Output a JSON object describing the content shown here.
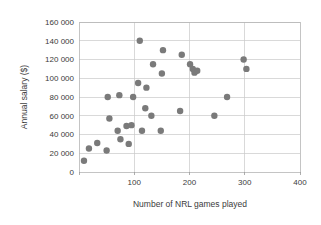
{
  "chart_data": {
    "type": "scatter",
    "title": "",
    "xlabel": "Number of NRL games played",
    "ylabel": "Annual salary ($)",
    "xlim": [
      0,
      400
    ],
    "ylim": [
      0,
      160000
    ],
    "grid": true,
    "legend": "none",
    "marker_color": "#7a7a7a",
    "xticks": [
      0,
      100,
      200,
      300,
      400
    ],
    "xtick_labels": [
      "",
      "100",
      "200",
      "300",
      "400"
    ],
    "yticks": [
      0,
      20000,
      40000,
      60000,
      80000,
      100000,
      120000,
      140000,
      160000
    ],
    "ytick_labels": [
      "0",
      "20 000",
      "40 000",
      "60 000",
      "80 000",
      "100 000",
      "120 000",
      "140 000",
      "160 000"
    ],
    "points": [
      [
        9,
        12000
      ],
      [
        18,
        25000
      ],
      [
        33,
        31000
      ],
      [
        50,
        23000
      ],
      [
        52,
        80000
      ],
      [
        55,
        57000
      ],
      [
        70,
        44000
      ],
      [
        73,
        82000
      ],
      [
        75,
        35000
      ],
      [
        86,
        49000
      ],
      [
        90,
        30000
      ],
      [
        95,
        50000
      ],
      [
        98,
        80000
      ],
      [
        107,
        95000
      ],
      [
        110,
        140000
      ],
      [
        114,
        44000
      ],
      [
        120,
        68000
      ],
      [
        122,
        90000
      ],
      [
        131,
        60000
      ],
      [
        134,
        115000
      ],
      [
        148,
        44000
      ],
      [
        150,
        105000
      ],
      [
        152,
        130000
      ],
      [
        183,
        65000
      ],
      [
        186,
        125000
      ],
      [
        201,
        115000
      ],
      [
        206,
        110000
      ],
      [
        209,
        106000
      ],
      [
        214,
        108000
      ],
      [
        245,
        60000
      ],
      [
        268,
        80000
      ],
      [
        298,
        120000
      ],
      [
        303,
        110000
      ]
    ]
  }
}
